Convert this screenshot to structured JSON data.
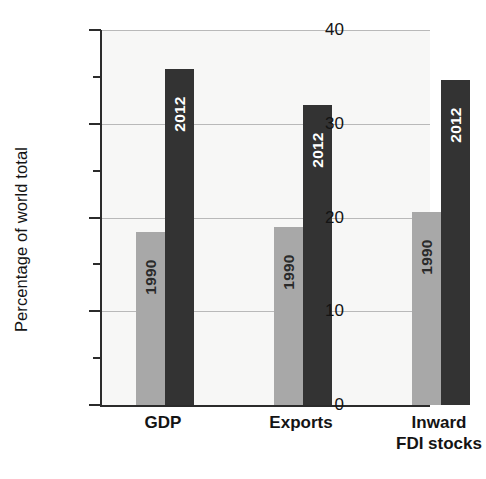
{
  "chart_data": {
    "type": "bar",
    "title": "",
    "xlabel": "",
    "ylabel": "Percentage of world total",
    "ylim": [
      0,
      40
    ],
    "ytick_major": [
      "0",
      "10",
      "20",
      "30",
      "40"
    ],
    "ytick_major_values": [
      0,
      10,
      20,
      30,
      40
    ],
    "ytick_minor_values": [
      5,
      15,
      25,
      35
    ],
    "grid": "horizontal-major",
    "legend": "none (bars are labelled in-place)",
    "categories": [
      "GDP",
      "Exports",
      "Inward FDI stocks"
    ],
    "series": [
      {
        "name": "1990",
        "color": "#a8a8a8",
        "values": [
          18.5,
          19.0,
          20.6
        ]
      },
      {
        "name": "2012",
        "color": "#333333",
        "values": [
          35.8,
          32.0,
          34.7
        ]
      }
    ],
    "bars": [
      {
        "category": "GDP",
        "series": "1990",
        "value": 18.5,
        "label": "1990",
        "color": "#a8a8a8"
      },
      {
        "category": "GDP",
        "series": "2012",
        "value": 35.8,
        "label": "2012",
        "color": "#333333"
      },
      {
        "category": "Exports",
        "series": "1990",
        "value": 19.0,
        "label": "1990",
        "color": "#a8a8a8"
      },
      {
        "category": "Exports",
        "series": "2012",
        "value": 32.0,
        "label": "2012",
        "color": "#333333"
      },
      {
        "category": "Inward FDI stocks",
        "series": "1990",
        "value": 20.6,
        "label": "1990",
        "color": "#a8a8a8"
      },
      {
        "category": "Inward FDI stocks",
        "series": "2012",
        "value": 34.7,
        "label": "2012",
        "color": "#333333"
      }
    ],
    "category_label_lines": [
      [
        "GDP"
      ],
      [
        "Exports"
      ],
      [
        "Inward",
        "FDI stocks"
      ]
    ]
  },
  "axis": {
    "y_title": "Percentage of world total",
    "y_ticks": [
      {
        "label": "40",
        "value": 40
      },
      {
        "label": "30",
        "value": 30
      },
      {
        "label": "20",
        "value": 20
      },
      {
        "label": "10",
        "value": 10
      },
      {
        "label": "0",
        "value": 0
      }
    ]
  },
  "colors": {
    "series_1990": "#a8a8a8",
    "series_2012": "#333333",
    "plot_background": "#f7f7f6",
    "gridline": "#b9b9b9",
    "axis": "#2b2b2b",
    "text": "#141414"
  }
}
